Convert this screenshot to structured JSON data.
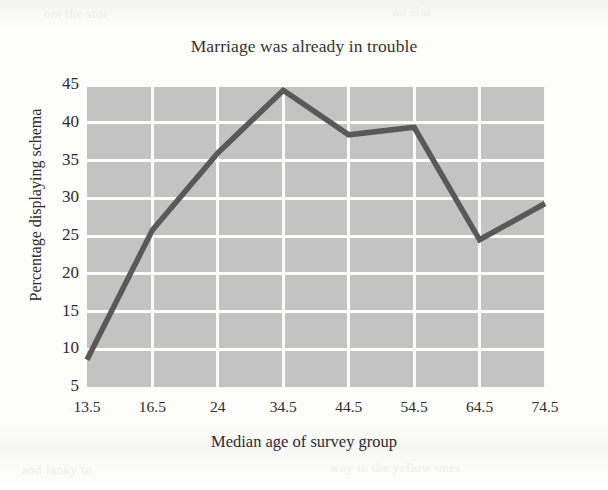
{
  "figure": {
    "title": "Marriage was already in trouble",
    "xlabel": "Median age of survey group",
    "ylabel": "Percentage displaying schema"
  },
  "colors": {
    "paper_background": "#fbfbfa",
    "plot_background": "#c3c3c3",
    "gridline": "#fbfbfa",
    "line_series": "#595959",
    "text": "#2e2b29"
  },
  "bleed_through": {
    "top_left": "om the stor",
    "top_right": "no elm",
    "bottom_left": "and lanky to",
    "bottom_right": "way to the yellow ones"
  },
  "chart_data": {
    "type": "line",
    "title": "Marriage was already in trouble",
    "xlabel": "Median age of survey group",
    "ylabel": "Percentage displaying schema",
    "categories": [
      "13.5",
      "16.5",
      "24",
      "34.5",
      "44.5",
      "54.5",
      "64.5",
      "74.5"
    ],
    "values": [
      8.6,
      25.8,
      36.0,
      44.3,
      38.4,
      39.4,
      24.5,
      29.3
    ],
    "xlim": [
      0,
      7
    ],
    "ylim": [
      5,
      45
    ],
    "ytick_labels": [
      "45",
      "40",
      "35",
      "30",
      "25",
      "20",
      "15",
      "10",
      "5"
    ],
    "ytick_values": [
      45,
      40,
      35,
      30,
      25,
      20,
      15,
      10,
      5
    ],
    "xtick_labels": [
      "13.5",
      "16.5",
      "24",
      "34.5",
      "44.5",
      "54.5",
      "64.5",
      "74.5"
    ],
    "grid": true,
    "grid_color": "#fbfbfa",
    "legend": null,
    "series": [
      {
        "name": "Percentage displaying schema",
        "color": "#595959",
        "values": [
          8.6,
          25.8,
          36.0,
          44.3,
          38.4,
          39.4,
          24.5,
          29.3
        ]
      }
    ]
  }
}
